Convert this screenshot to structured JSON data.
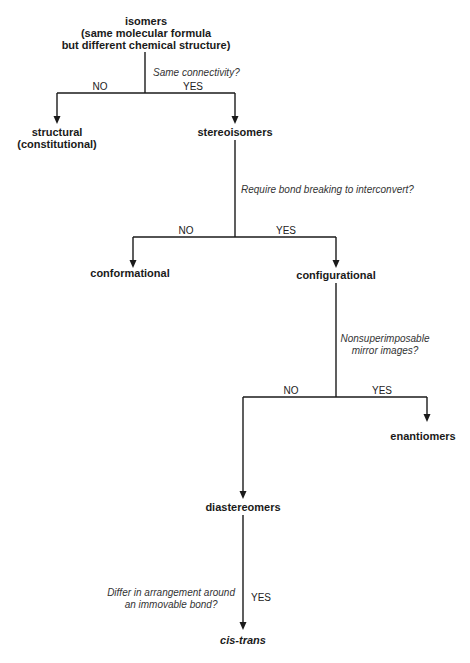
{
  "diagram": {
    "nodes": {
      "isomers": {
        "lines": [
          "isomers",
          "(same molecular formula",
          "but different chemical structure)"
        ]
      },
      "structural": {
        "lines": [
          "structural",
          "(constitutional)"
        ]
      },
      "stereoisomers": {
        "label": "stereoisomers"
      },
      "conformational": {
        "label": "conformational"
      },
      "configurational": {
        "label": "configurational"
      },
      "enantiomers": {
        "label": "enantiomers"
      },
      "diastereomers": {
        "label": "diastereomers"
      },
      "cis_trans": {
        "label": "cis-trans"
      }
    },
    "questions": {
      "q1": {
        "label": "Same connectivity?"
      },
      "q2": {
        "label": "Require bond breaking to interconvert?"
      },
      "q3": {
        "lines": [
          "Nonsuperimposable",
          "mirror images?"
        ]
      },
      "q4": {
        "lines": [
          "Differ in arrangement around",
          "an immovable bond?"
        ]
      }
    },
    "answers": {
      "no": "NO",
      "yes": "YES"
    },
    "edges": [
      {
        "from": "isomers",
        "to": "structural",
        "answer": "NO"
      },
      {
        "from": "isomers",
        "to": "stereoisomers",
        "answer": "YES"
      },
      {
        "from": "stereoisomers",
        "to": "conformational",
        "answer": "NO"
      },
      {
        "from": "stereoisomers",
        "to": "configurational",
        "answer": "YES"
      },
      {
        "from": "configurational",
        "to": "diastereomers",
        "answer": "NO"
      },
      {
        "from": "configurational",
        "to": "enantiomers",
        "answer": "YES"
      },
      {
        "from": "diastereomers",
        "to": "cis_trans",
        "answer": "YES"
      }
    ],
    "colors": {
      "line": "#1a1a1a",
      "text": "#1a1a1a",
      "background": "#ffffff"
    }
  }
}
